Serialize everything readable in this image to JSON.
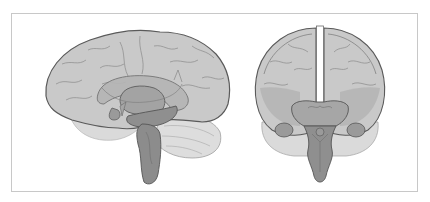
{
  "figure": {
    "type": "anatomical-illustration",
    "views": [
      {
        "id": "sagittal",
        "label": "Lateral/sagittal view"
      },
      {
        "id": "coronal",
        "label": "Frontal/coronal view"
      }
    ],
    "colors": {
      "frame_border": "#c8c8c8",
      "cortex_fill": "#c9c9c9",
      "cortex_stroke": "#5a5a5a",
      "gyri_line": "#8a8a8a",
      "inner_fill": "#a9a9a9",
      "deep_fill": "#8f8f8f",
      "brainstem_fill": "#8c8c8c",
      "cerebellum_fill": "#dcdcdc",
      "background": "#ffffff"
    }
  }
}
